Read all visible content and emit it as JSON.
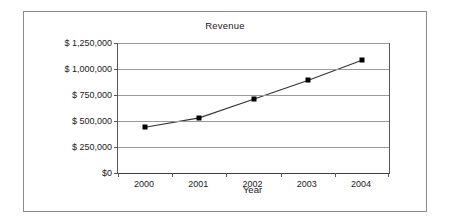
{
  "chart_data": {
    "type": "line",
    "title": "Revenue",
    "xlabel": "Year",
    "ylabel": "",
    "categories": [
      "2000",
      "2001",
      "2002",
      "2003",
      "2004"
    ],
    "values": [
      440000,
      530000,
      710000,
      890000,
      1085000
    ],
    "series": [
      {
        "name": "Revenue",
        "values": [
          440000,
          530000,
          710000,
          890000,
          1085000
        ]
      }
    ],
    "ylim": [
      0,
      1250000
    ],
    "ytick_values": [
      1250000,
      1000000,
      750000,
      500000,
      250000,
      0
    ],
    "ytick_labels": [
      "$ 1,250,000",
      "$ 1,000,000",
      "$ 750,000",
      "$ 500,000",
      "$ 250,000",
      "$0"
    ],
    "grid": true,
    "legend": false,
    "marker": "square",
    "marker_color": "#000000",
    "line_color": "#333333",
    "gridline_color": "#9a9a9a",
    "axis_color": "#595959",
    "border_color": "#8c8c8c",
    "background": "#ffffff"
  }
}
